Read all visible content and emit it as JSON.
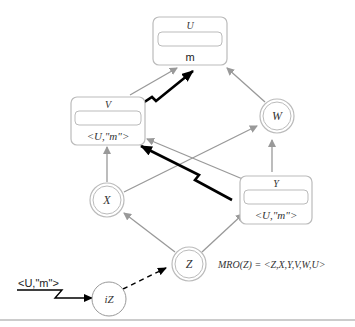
{
  "diagram": {
    "nodes": {
      "U": {
        "name": "U",
        "value": "m",
        "type": "box"
      },
      "V": {
        "name": "V",
        "value": "<U,\"m\">",
        "type": "box"
      },
      "W": {
        "name": "W",
        "type": "circle"
      },
      "X": {
        "name": "X",
        "type": "circle"
      },
      "Y": {
        "name": "Y",
        "value": "<U,\"m\">",
        "type": "box"
      },
      "Z": {
        "name": "Z",
        "type": "circle"
      },
      "iZ": {
        "name": "iZ",
        "type": "circle-single"
      }
    },
    "input_label": "<U,\"m\">",
    "mro_label": "MRO(Z) = <Z,X,Y,V,W,U>",
    "edges": [
      {
        "from": "V",
        "to": "U",
        "style": "gray"
      },
      {
        "from": "W",
        "to": "U",
        "style": "gray"
      },
      {
        "from": "X",
        "to": "V",
        "style": "gray"
      },
      {
        "from": "X",
        "to": "W",
        "style": "gray"
      },
      {
        "from": "Y",
        "to": "V",
        "style": "gray"
      },
      {
        "from": "Y",
        "to": "W",
        "style": "gray"
      },
      {
        "from": "Z",
        "to": "X",
        "style": "gray"
      },
      {
        "from": "Z",
        "to": "Y",
        "style": "gray"
      },
      {
        "from": "iZ",
        "to": "Z",
        "style": "dashed"
      },
      {
        "from": "V",
        "to": "U",
        "style": "message-bold"
      },
      {
        "from": "Y",
        "to": "V",
        "style": "message-bold"
      },
      {
        "from": "input",
        "to": "iZ",
        "style": "message"
      }
    ],
    "colors": {
      "gray_edge": "#999999",
      "bold_edge": "#000000",
      "node_border": "#bbbbbb"
    }
  }
}
